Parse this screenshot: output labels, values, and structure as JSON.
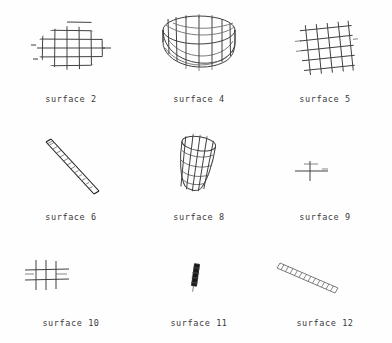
{
  "figure": {
    "background_color": "#fefefe",
    "line_color": "#404040",
    "caption_color": "#3a3a3a",
    "rows": 3,
    "columns": 3
  },
  "panels": [
    {
      "id": "surface-2",
      "caption": "surface 2",
      "shape": "elliptical-planar-grid",
      "description": "flat horizontal mesh clipped to an ellipse",
      "grid_rows": 5,
      "grid_cols": 6
    },
    {
      "id": "surface-4",
      "caption": "surface 4",
      "shape": "cylinder-drum-wireframe",
      "description": "open cylinder viewed from above with elliptical rims",
      "ribs": 12,
      "bands": 4
    },
    {
      "id": "surface-5",
      "caption": "surface 5",
      "shape": "tilted-square-grid",
      "description": "planar square mesh rotated slightly",
      "grid_rows": 5,
      "grid_cols": 5
    },
    {
      "id": "surface-6",
      "caption": "surface 6",
      "shape": "diagonal-strip-ladder",
      "description": "narrow elongated strip running upper-left to lower-right",
      "rungs": 14
    },
    {
      "id": "surface-8",
      "caption": "surface 8",
      "shape": "tilted-cylinder-wireframe",
      "description": "small tube leaning to the right",
      "ribs": 9,
      "bands": 5
    },
    {
      "id": "surface-9",
      "caption": "surface 9",
      "shape": "edge-on-cross",
      "description": "surface seen nearly edge-on, drawn as a small cross",
      "rungs": 2
    },
    {
      "id": "surface-10",
      "caption": "surface 10",
      "shape": "small-grid",
      "description": "small planar mesh of a few crossing lines",
      "grid_rows": 2,
      "grid_cols": 3
    },
    {
      "id": "surface-11",
      "caption": "surface 11",
      "shape": "tiny-dark-sliver",
      "description": "very small near-vertical dark patch",
      "rungs": 5
    },
    {
      "id": "surface-12",
      "caption": "surface 12",
      "shape": "diagonal-strip-ladder",
      "description": "narrow light strip running upper-left to lower-right",
      "rungs": 13
    }
  ]
}
